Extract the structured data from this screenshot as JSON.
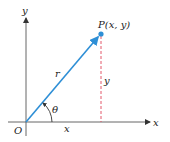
{
  "diagram": {
    "type": "polar-coordinates",
    "labels": {
      "y_axis": "y",
      "x_axis": "x",
      "origin": "O",
      "point": "P(x, y)",
      "radius": "r",
      "angle": "θ",
      "horizontal_leg": "x",
      "vertical_leg": "y"
    },
    "colors": {
      "axis": "#555555",
      "vector": "#2e8fd6",
      "point": "#2e8fd6",
      "dashed": "#e0455a",
      "text": "#222222"
    }
  }
}
